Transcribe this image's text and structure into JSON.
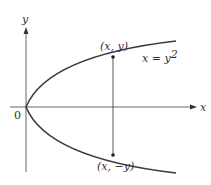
{
  "figure": {
    "axes": {
      "x_label": "x",
      "y_label": "y",
      "origin_label": "0"
    },
    "curve_label_lhs": "x = y",
    "curve_label_exp": "2",
    "points": [
      {
        "label": "(x, y)"
      },
      {
        "label": "(x, −y)"
      }
    ],
    "colors": {
      "curve": "#3a3a3a",
      "axes": "#555555"
    }
  }
}
